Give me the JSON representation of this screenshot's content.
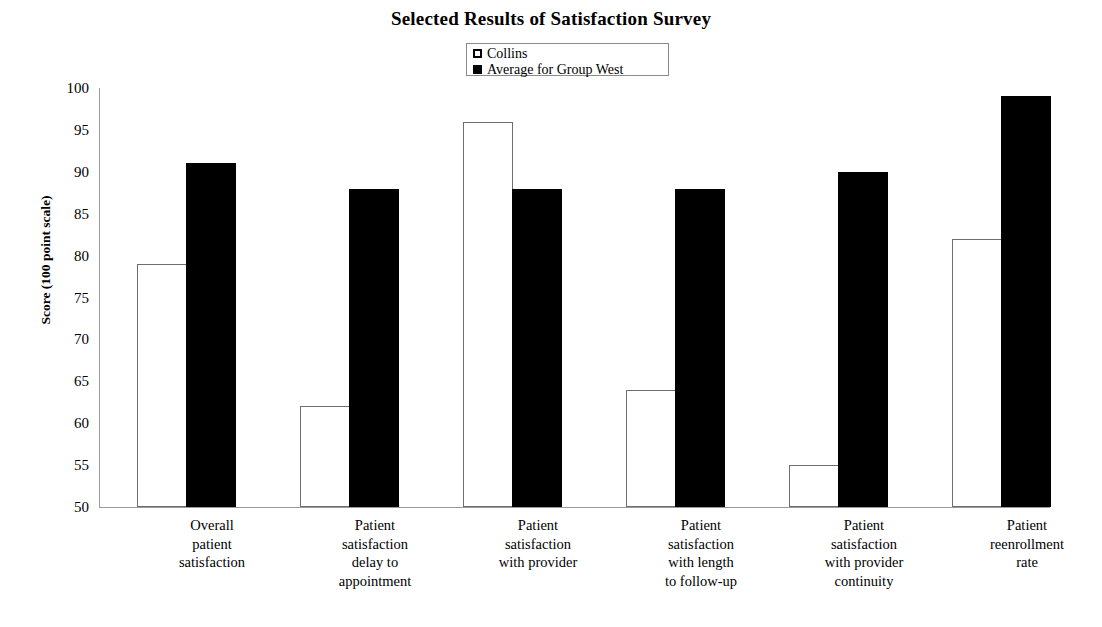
{
  "chart_data": {
    "type": "bar",
    "title": "Selected Results of Satisfaction Survey",
    "xlabel": "",
    "ylabel": "Score (100 point scale)",
    "ylim": [
      50,
      100
    ],
    "ytick_step": 5,
    "yticks": [
      100,
      95,
      90,
      85,
      80,
      75,
      70,
      65,
      60,
      55,
      50
    ],
    "grid": false,
    "legend_position": "top-center",
    "categories": [
      "Overall patient satisfaction",
      "Patient satisfaction delay to appointment",
      "Patient satisfaction with provider",
      "Patient satisfaction with length to follow-up",
      "Patient satisfaction with provider continuity",
      "Patient reenrollment rate"
    ],
    "category_lines": [
      [
        "Overall",
        "patient",
        "satisfaction"
      ],
      [
        "Patient",
        "satisfaction",
        "delay to",
        "appointment"
      ],
      [
        "Patient",
        "satisfaction",
        "with provider"
      ],
      [
        "Patient",
        "satisfaction",
        "with length",
        "to follow-up"
      ],
      [
        "Patient",
        "satisfaction",
        "with provider",
        "continuity"
      ],
      [
        "Patient",
        "reenrollment",
        "rate"
      ]
    ],
    "series": [
      {
        "name": "Collins",
        "color": "#ffffff",
        "edge_color": "#6e6e6e",
        "swatch": "hollow",
        "values": [
          79,
          62,
          96,
          64,
          55,
          82
        ]
      },
      {
        "name": "Average for Group West",
        "color": "#000000",
        "edge_color": "#000000",
        "swatch": "filled",
        "values": [
          91,
          88,
          88,
          88,
          90,
          99
        ]
      }
    ]
  },
  "legend": {
    "items": [
      {
        "label": "Collins",
        "swatch": "hollow"
      },
      {
        "label": "Average for Group West",
        "swatch": "filled"
      }
    ]
  }
}
